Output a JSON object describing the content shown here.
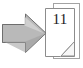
{
  "icon": {
    "name": "go-to-page-icon",
    "description": "Grey block arrow pointing right at a stack of two document pages with a page number and folded corner",
    "canvas": {
      "width": 83,
      "height": 68,
      "background_color": "#ffffff"
    },
    "arrow": {
      "name": "right-arrow-icon",
      "direction": "right",
      "fill_color": "#b9b9b9",
      "highlight_color": "#d2d2d2",
      "shadow_color": "#8f8f8f",
      "outline_color": "#6e6e6e"
    },
    "document_stack": {
      "name": "document-stack-icon",
      "page_count": 2,
      "page_fill_color": "#ffffff",
      "page_border_color": "#8c8c8c",
      "back_page_border_color": "#a3a3a3",
      "fold_fill_color": "#f7f7f7",
      "fold_border_color": "#8c8c8c",
      "page_number": "11"
    }
  }
}
